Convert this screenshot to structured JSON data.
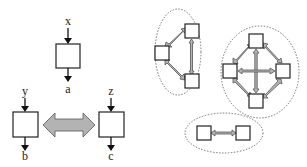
{
  "left_diagram": {
    "top_block": {
      "input": "x",
      "output": "a"
    },
    "left_block": {
      "input": "y",
      "output": "b"
    },
    "right_block": {
      "input": "z",
      "output": "c"
    },
    "connection": "bidirectional gray arrow between left and right blocks"
  },
  "right_diagram": {
    "groups": [
      {
        "name": "three-node cluster",
        "nodes": 3,
        "links": [
          "top-left",
          "left-bottom",
          "top-bottom"
        ]
      },
      {
        "name": "four-node cluster",
        "nodes": 4,
        "links": [
          "top-left",
          "top-right",
          "left-bottom",
          "right-bottom",
          "top-bottom",
          "left-right"
        ]
      },
      {
        "name": "two-node cluster",
        "nodes": 2,
        "links": [
          "left-right"
        ]
      }
    ]
  },
  "colors": {
    "arrow_fill": "#b3b3b3",
    "stroke": "#222222",
    "background": "#ffffff"
  }
}
